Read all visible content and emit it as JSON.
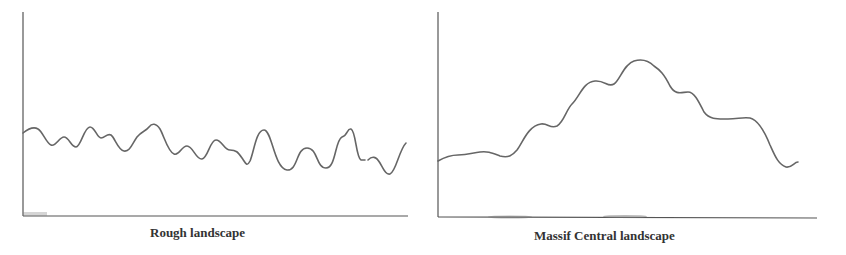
{
  "panels": [
    {
      "id": "left",
      "label": "Rough landscape",
      "description": "Low, closely spaced irregular ridges and valleys"
    },
    {
      "id": "right",
      "label": "Massif Central landscape",
      "description": "Broad single massif rising from low plain to a central peak then descending"
    }
  ],
  "colors": {
    "axis": "#555555",
    "curve": "#666666",
    "text": "#333333",
    "background": "#ffffff"
  }
}
